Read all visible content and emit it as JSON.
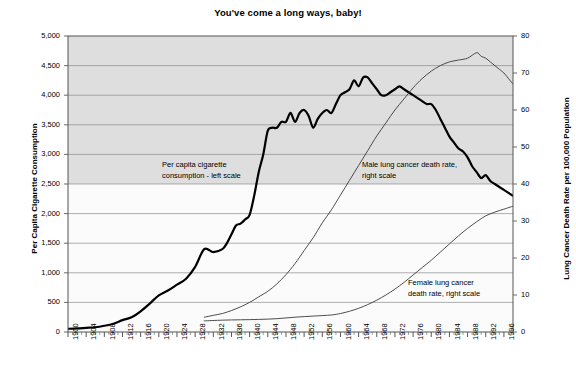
{
  "chart_data": {
    "type": "line",
    "title": "You've come a long ways, baby!",
    "xlabel": "",
    "ylabel": "Per Capita Cigarette Consumption",
    "ylabel_right": "Lung Cancer Death Rate per 100,000 Population",
    "xlim": [
      1900,
      1998
    ],
    "ylim": [
      0,
      5000
    ],
    "ylim_right": [
      0,
      80
    ],
    "grid": true,
    "legend_position": "inline-annotations",
    "yticks": [
      "0",
      "500",
      "1,000",
      "1,500",
      "2,000",
      "2,500",
      "3,000",
      "3,500",
      "4,000",
      "4,500",
      "5,000"
    ],
    "yticks_right": [
      "0",
      "10",
      "20",
      "30",
      "40",
      "50",
      "60",
      "70",
      "80"
    ],
    "xticks": [
      "1900",
      "1904",
      "1908",
      "1912",
      "1916",
      "1920",
      "1924",
      "1928",
      "1932",
      "1936",
      "1940",
      "1944",
      "1948",
      "1952",
      "1956",
      "1960",
      "1964",
      "1968",
      "1972",
      "1976",
      "1980",
      "1984",
      "1988",
      "1992",
      "1996"
    ],
    "annotations": [
      {
        "id": "cigarette",
        "line1": "Per capita cigarette",
        "line2": "consumption - left scale"
      },
      {
        "id": "male",
        "line1": "Male lung cancer death rate,",
        "line2": "right scale"
      },
      {
        "id": "female",
        "line1": "Female lung cancer",
        "line2": "death rate, right scale"
      }
    ],
    "series": [
      {
        "name": "Per capita cigarette consumption",
        "axis": "left",
        "color": "#000000",
        "width": 2.2,
        "x": [
          1900,
          1902,
          1904,
          1906,
          1908,
          1910,
          1912,
          1914,
          1916,
          1918,
          1920,
          1922,
          1924,
          1926,
          1928,
          1930,
          1932,
          1934,
          1935,
          1936,
          1937,
          1938,
          1939,
          1940,
          1941,
          1942,
          1943,
          1944,
          1945,
          1946,
          1947,
          1948,
          1949,
          1950,
          1951,
          1952,
          1953,
          1954,
          1955,
          1956,
          1957,
          1958,
          1959,
          1960,
          1961,
          1962,
          1963,
          1964,
          1965,
          1966,
          1967,
          1968,
          1969,
          1970,
          1971,
          1972,
          1973,
          1974,
          1975,
          1976,
          1977,
          1978,
          1979,
          1980,
          1981,
          1982,
          1983,
          1984,
          1985,
          1986,
          1987,
          1988,
          1989,
          1990,
          1991,
          1992,
          1993,
          1994,
          1995,
          1996,
          1997,
          1998
        ],
        "y": [
          54,
          60,
          70,
          80,
          105,
          140,
          200,
          250,
          350,
          480,
          620,
          700,
          800,
          900,
          1100,
          1400,
          1350,
          1400,
          1500,
          1650,
          1800,
          1830,
          1900,
          1980,
          2300,
          2700,
          3000,
          3400,
          3450,
          3450,
          3550,
          3550,
          3700,
          3550,
          3700,
          3750,
          3650,
          3450,
          3600,
          3700,
          3750,
          3700,
          3850,
          4000,
          4050,
          4100,
          4250,
          4150,
          4300,
          4300,
          4200,
          4100,
          4000,
          4000,
          4050,
          4100,
          4150,
          4100,
          4050,
          4000,
          3950,
          3900,
          3850,
          3850,
          3750,
          3600,
          3450,
          3300,
          3200,
          3100,
          3050,
          2950,
          2800,
          2700,
          2600,
          2650,
          2550,
          2500,
          2450,
          2400,
          2350,
          2300
        ]
      },
      {
        "name": "Male lung cancer death rate",
        "axis": "right",
        "color": "#3a3a3a",
        "width": 0.9,
        "x": [
          1930,
          1932,
          1934,
          1936,
          1938,
          1940,
          1942,
          1944,
          1946,
          1948,
          1950,
          1952,
          1954,
          1956,
          1958,
          1960,
          1962,
          1964,
          1966,
          1968,
          1970,
          1972,
          1974,
          1976,
          1978,
          1980,
          1982,
          1984,
          1986,
          1988,
          1990,
          1991,
          1992,
          1993,
          1994,
          1995,
          1996,
          1997,
          1998
        ],
        "y": [
          4.0,
          4.5,
          5.0,
          5.8,
          6.8,
          8.0,
          9.5,
          11.0,
          13.0,
          15.5,
          18.5,
          22.0,
          25.5,
          29.5,
          33.0,
          37.0,
          41.0,
          45.0,
          49.0,
          53.0,
          56.5,
          60.0,
          63.0,
          66.0,
          68.5,
          70.5,
          72.0,
          73.0,
          73.5,
          74.0,
          75.5,
          74.5,
          74.0,
          73.0,
          72.0,
          71.0,
          70.0,
          68.5,
          67.0
        ]
      },
      {
        "name": "Female lung cancer death rate",
        "axis": "right",
        "color": "#3a3a3a",
        "width": 0.9,
        "x": [
          1930,
          1934,
          1938,
          1942,
          1946,
          1950,
          1954,
          1958,
          1960,
          1962,
          1964,
          1966,
          1968,
          1970,
          1972,
          1974,
          1976,
          1978,
          1980,
          1982,
          1984,
          1986,
          1988,
          1990,
          1992,
          1994,
          1996,
          1998
        ],
        "y": [
          3.0,
          3.2,
          3.3,
          3.4,
          3.6,
          4.0,
          4.3,
          4.6,
          5.0,
          5.6,
          6.4,
          7.4,
          8.6,
          10.0,
          11.6,
          13.4,
          15.4,
          17.4,
          19.4,
          21.6,
          23.8,
          26.0,
          28.0,
          29.8,
          31.4,
          32.4,
          33.2,
          34.0
        ]
      }
    ]
  }
}
